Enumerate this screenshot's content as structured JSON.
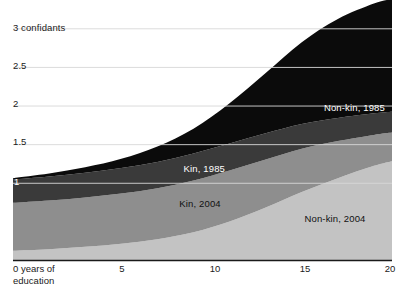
{
  "chart_data": {
    "type": "area",
    "stacked": true,
    "title": "",
    "xlabel": "years of education",
    "ylabel": "confidants",
    "xlim": [
      0,
      21
    ],
    "ylim": [
      0,
      3.25
    ],
    "grid": true,
    "legend_position": "inline-annotations",
    "x_tick_labels": [
      "0 years of\neducation",
      "5",
      "10",
      "15",
      "20"
    ],
    "x_ticks": [
      0,
      5,
      10,
      15,
      20
    ],
    "y_ticks": [
      1,
      1.5,
      2,
      2.5,
      3
    ],
    "y_tick_labels": [
      "1",
      "1.5",
      "2",
      "2.5",
      "3 confidants"
    ],
    "x": [
      0,
      2,
      4,
      6,
      8,
      10,
      12,
      14,
      16,
      18,
      20,
      21
    ],
    "series": [
      {
        "name": "Non-kin, 2004",
        "color": "#c3c3c3",
        "label_color": "#111111",
        "values": [
          0.12,
          0.14,
          0.17,
          0.21,
          0.27,
          0.36,
          0.5,
          0.68,
          0.88,
          1.06,
          1.22,
          1.28
        ]
      },
      {
        "name": "Kin, 2004",
        "color": "#8e8e8e",
        "label_color": "#111111",
        "values": [
          0.62,
          0.63,
          0.64,
          0.65,
          0.66,
          0.67,
          0.66,
          0.62,
          0.56,
          0.48,
          0.4,
          0.37
        ]
      },
      {
        "name": "Kin, 1985",
        "color": "#3a3a3a",
        "label_color": "#ffffff",
        "values": [
          0.3,
          0.31,
          0.32,
          0.33,
          0.34,
          0.35,
          0.35,
          0.34,
          0.32,
          0.3,
          0.28,
          0.27
        ]
      },
      {
        "name": "Non-kin, 1985",
        "color": "#0b0b0b",
        "label_color": "#ffffff",
        "values": [
          0.02,
          0.04,
          0.07,
          0.12,
          0.2,
          0.32,
          0.52,
          0.78,
          1.06,
          1.28,
          1.42,
          1.46
        ]
      }
    ],
    "annotations": [
      {
        "text": "Non-kin, 1985",
        "x_px": 385,
        "y_px": 107,
        "align": "right",
        "color": "#ffffff"
      },
      {
        "text": "Kin, 1985",
        "x_px": 225,
        "y_px": 168,
        "align": "right",
        "color": "#ffffff"
      },
      {
        "text": "Kin, 2004",
        "x_px": 200,
        "y_px": 203,
        "align": "center",
        "color": "#111111"
      },
      {
        "text": "Non-kin, 2004",
        "x_px": 335,
        "y_px": 218,
        "align": "center",
        "color": "#111111"
      }
    ]
  },
  "axis": {
    "y_labels": [
      {
        "text": "3 confidants",
        "top": 22,
        "on_dark": false
      },
      {
        "text": "2.5",
        "top": 60,
        "on_dark": false
      },
      {
        "text": "2",
        "top": 98,
        "on_dark": false
      },
      {
        "text": "1.5",
        "top": 136,
        "on_dark": false
      },
      {
        "text": "1",
        "top": 176,
        "on_dark": true
      }
    ],
    "x_labels": [
      {
        "line1": "0 years of",
        "line2": "education",
        "left": 13
      },
      {
        "text": "5",
        "left": 122
      },
      {
        "text": "10",
        "left": 215
      },
      {
        "text": "15",
        "left": 305
      },
      {
        "text": "20",
        "left": 390
      }
    ]
  },
  "colors": {
    "non_kin_2004": "#c3c3c3",
    "kin_2004": "#8e8e8e",
    "kin_1985": "#3a3a3a",
    "non_kin_1985": "#0b0b0b",
    "grid": "#d0d0d0",
    "axis": "#1a1a1a",
    "background": "#ffffff"
  }
}
